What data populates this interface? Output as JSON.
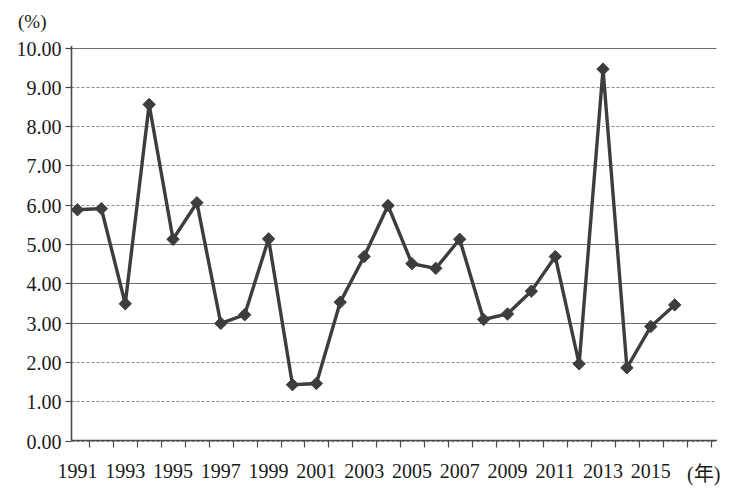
{
  "chart_data": {
    "type": "line",
    "title": "",
    "subtitle": "",
    "unit_label": "(%)",
    "xlabel": "(年)",
    "ylabel": "",
    "ylim": [
      0,
      10
    ],
    "ytick_labels": [
      "10.00",
      "9.00",
      "8.00",
      "7.00",
      "6.00",
      "5.00",
      "4.00",
      "3.00",
      "2.00",
      "1.00",
      "0.00"
    ],
    "ytick_values": [
      10,
      9,
      8,
      7,
      6,
      5,
      4,
      3,
      2,
      1,
      0
    ],
    "xtick_labels": [
      "1991",
      "1993",
      "1995",
      "1997",
      "1999",
      "2001",
      "2003",
      "2005",
      "2007",
      "2009",
      "2011",
      "2013",
      "2015"
    ],
    "grid": true,
    "grid_axis": "y",
    "legend": false,
    "legend_position": "none",
    "marker": "diamond",
    "line_color": "#3d3d3d",
    "x": [
      1991,
      1992,
      1993,
      1994,
      1995,
      1996,
      1997,
      1998,
      1999,
      2000,
      2001,
      2002,
      2003,
      2004,
      2005,
      2006,
      2007,
      2008,
      2009,
      2010,
      2011,
      2012,
      2013,
      2014,
      2015,
      2016
    ],
    "values": [
      5.87,
      5.9,
      3.48,
      8.55,
      5.12,
      6.05,
      2.98,
      3.2,
      5.13,
      1.42,
      1.45,
      3.52,
      4.68,
      5.98,
      4.5,
      4.38,
      5.12,
      3.08,
      3.22,
      3.8,
      4.68,
      1.95,
      9.45,
      1.85,
      2.9,
      3.45
    ],
    "series": [
      {
        "name": "",
        "values": [
          5.87,
          5.9,
          3.48,
          8.55,
          5.12,
          6.05,
          2.98,
          3.2,
          5.13,
          1.42,
          1.45,
          3.52,
          4.68,
          5.98,
          4.5,
          4.38,
          5.12,
          3.08,
          3.22,
          3.8,
          4.68,
          1.95,
          9.45,
          1.85,
          2.9,
          3.45
        ]
      }
    ]
  }
}
